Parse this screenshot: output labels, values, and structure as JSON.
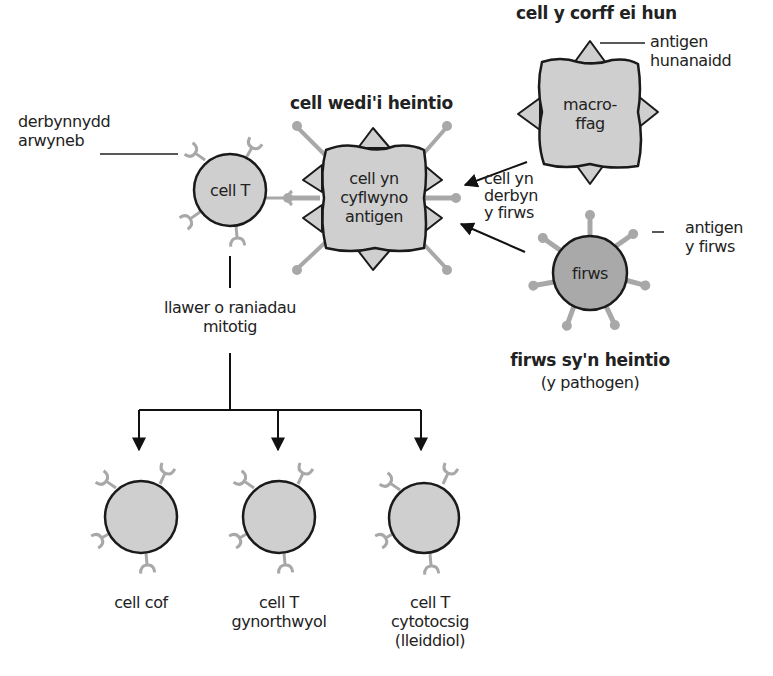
{
  "diagram": {
    "title_infected": "cell wedi'i heintio",
    "title_self": "cell y corff ei hun",
    "title_virus": "firws sy'n heintio",
    "subtitle_virus": "(y pathogen)",
    "t_cell": {
      "label": "cell T"
    },
    "surface_receptor": {
      "line1": "derbynnydd",
      "line2": "arwyneb"
    },
    "infected_cell": {
      "line1": "cell yn",
      "line2": "cyflwyno",
      "line3": "antigen"
    },
    "macrophage": {
      "line1": "macro-",
      "line2": "ffag"
    },
    "self_antigen": {
      "line1": "antigen",
      "line2": "hunanaidd"
    },
    "virus": {
      "label": "firws"
    },
    "virus_antigen": {
      "line1": "antigen",
      "line2": "y firws"
    },
    "uptake": {
      "line1": "cell yn",
      "line2": "derbyn",
      "line3": "y firws"
    },
    "division": {
      "line1": "llawer o raniadau",
      "line2": "mitotig"
    },
    "daughters": [
      {
        "line1": "cell cof"
      },
      {
        "line1": "cell T",
        "line2": "gynorthwyol"
      },
      {
        "line1": "cell T",
        "line2": "cytotocsig",
        "line3": "(lleiddiol)"
      }
    ],
    "colors": {
      "cell_fill": "#cfcfcf",
      "virus_fill": "#a9a9a9",
      "receptor": "#a8a8a8",
      "outline": "#1a1a1a"
    }
  }
}
